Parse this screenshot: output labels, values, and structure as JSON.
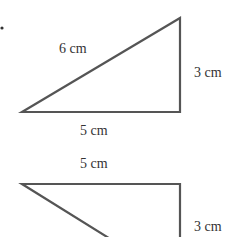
{
  "figure": {
    "bullet": "•",
    "triangle_1": {
      "hypotenuse_label": "6 cm",
      "vertical_label": "3 cm",
      "base_label": "5 cm"
    },
    "triangle_2": {
      "top_label": "5 cm",
      "vertical_label": "3 cm"
    },
    "colors": {
      "stroke": "#555555",
      "text": "#333333",
      "background": "#ffffff"
    }
  }
}
